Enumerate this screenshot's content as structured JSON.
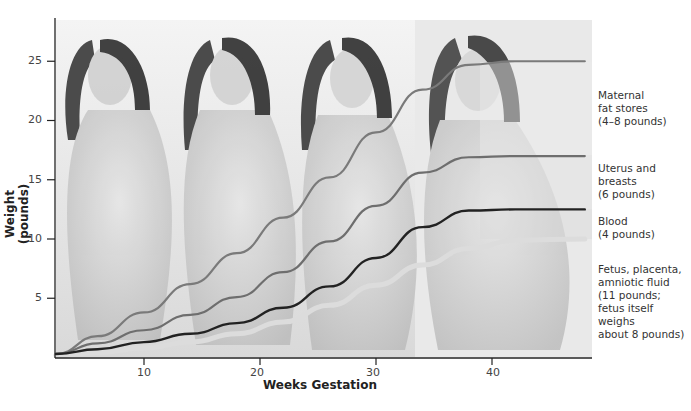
{
  "chart_data": {
    "type": "line",
    "title": "",
    "xlabel": "Weeks Gestation",
    "ylabel": "Weight (pounds)",
    "xlim": [
      2,
      48
    ],
    "ylim": [
      0,
      28
    ],
    "grid": false,
    "legend_position": "right (direct labels at curve ends)",
    "x_ticks": [
      10,
      20,
      30,
      40
    ],
    "y_ticks": [
      5,
      10,
      15,
      20,
      25
    ],
    "background": "illustration of a woman at four stages of pregnancy",
    "x": [
      2,
      6,
      10,
      14,
      18,
      22,
      26,
      30,
      34,
      38,
      42,
      48
    ],
    "series": [
      {
        "name": "Maternal fat stores (4–8 pounds)",
        "cumulative": true,
        "values": [
          0.3,
          1.8,
          3.8,
          6.2,
          8.8,
          11.8,
          15.2,
          19.0,
          22.6,
          24.7,
          25.0,
          25.0
        ],
        "color": "#7a7a7a"
      },
      {
        "name": "Uterus and breasts (6 pounds)",
        "cumulative": true,
        "values": [
          0.3,
          1.2,
          2.3,
          3.6,
          5.1,
          7.2,
          9.8,
          12.8,
          15.6,
          16.9,
          17.0,
          17.0
        ],
        "color": "#6e6e6e"
      },
      {
        "name": "Blood (4 pounds)",
        "cumulative": true,
        "values": [
          0.3,
          0.7,
          1.3,
          2.0,
          2.9,
          4.2,
          6.0,
          8.4,
          11.0,
          12.4,
          12.5,
          12.5
        ],
        "color": "#222222"
      },
      {
        "name": "Fetus, placenta, amniotic fluid (11 pounds; fetus itself weighs about 8 pounds)",
        "cumulative": true,
        "values": [
          0.2,
          0.4,
          0.8,
          1.3,
          2.0,
          3.0,
          4.4,
          6.1,
          7.8,
          9.2,
          9.9,
          10.0
        ],
        "color": "#dcdcdc"
      }
    ]
  },
  "axes": {
    "ylabel": "Weight (pounds)",
    "xlabel": "Weeks Gestation",
    "y_tick_labels": [
      "25",
      "20",
      "15",
      "10",
      "5"
    ],
    "x_tick_labels": [
      "10",
      "20",
      "30",
      "40"
    ]
  },
  "legend": [
    {
      "lines": [
        "Maternal",
        "fat stores",
        "(4–8 pounds)"
      ]
    },
    {
      "lines": [
        "Uterus and",
        "breasts",
        "(6 pounds)"
      ]
    },
    {
      "lines": [
        "Blood",
        "(4 pounds)"
      ]
    },
    {
      "lines": [
        "Fetus, placenta,",
        "amniotic fluid",
        "(11 pounds;",
        "fetus itself weighs",
        "about 8 pounds)"
      ]
    }
  ]
}
